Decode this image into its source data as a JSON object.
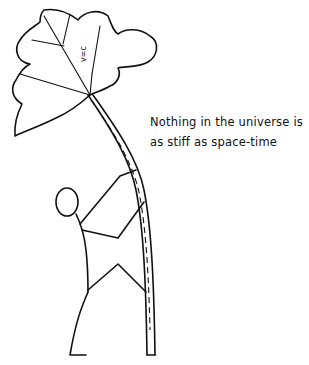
{
  "illustration": {
    "canopy_label": "v=c",
    "caption": {
      "line1": "Nothing in the universe is",
      "line2": "as stiff as space-time"
    }
  },
  "colors": {
    "background": "#ffffff",
    "ink": "#111111"
  }
}
